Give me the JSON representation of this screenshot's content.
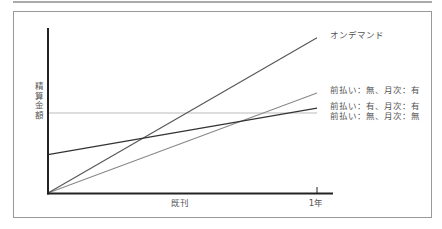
{
  "chart_data": {
    "type": "line",
    "title": "",
    "xlabel": "既刊",
    "ylabel": "精算金額",
    "x": [
      0,
      1
    ],
    "x_tick_labels": [
      "",
      "1年"
    ],
    "xlim": [
      0,
      1.2
    ],
    "ylim": [
      0,
      205
    ],
    "grid": false,
    "legend_position": "right, inline labels at line ends",
    "series": [
      {
        "name": "オンデマンド",
        "values": [
          0,
          194
        ],
        "color": "#555555"
      },
      {
        "name": "前払い：無、月次：有",
        "values": [
          0,
          125
        ],
        "color": "#888888"
      },
      {
        "name": "前払い：有、月次：有",
        "values": [
          48,
          106
        ],
        "color": "#333333"
      },
      {
        "name": "前払い：無、月次：無",
        "values": [
          100,
          100
        ],
        "color": "#bbbbbb"
      }
    ]
  },
  "frame": {
    "border_color": "#999999",
    "rule_color": "#aaaaaa",
    "axis_color": "#222222"
  }
}
